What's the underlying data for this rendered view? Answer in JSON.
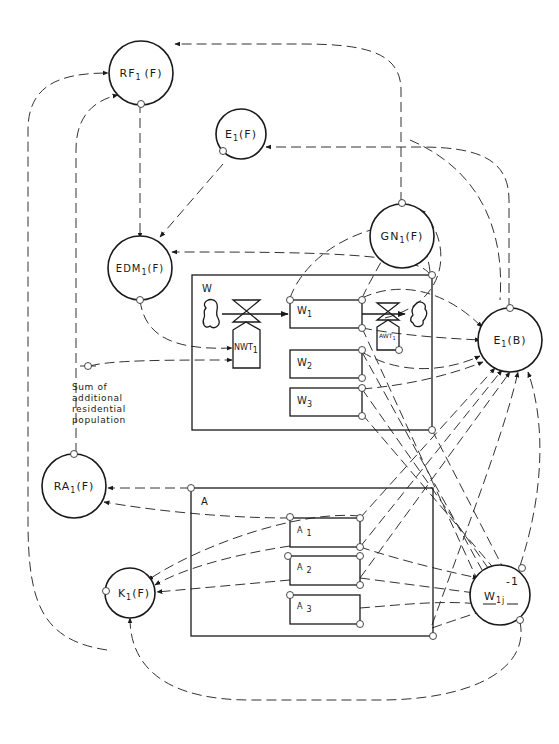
{
  "diagram": {
    "type": "system flow diagram",
    "nodes": {
      "rf1": {
        "main": "RF",
        "sub": "1",
        "suffix": "(F)"
      },
      "e1f": {
        "main": "E",
        "sub": "1",
        "suffix": "(F)"
      },
      "gn1": {
        "main": "GN",
        "sub": "1",
        "suffix": "(F)"
      },
      "edm1": {
        "main": "EDM",
        "sub": "1",
        "suffix": "(F)"
      },
      "e1b": {
        "main": "E",
        "sub": "1",
        "suffix": "(B)"
      },
      "ra1": {
        "main": "RA",
        "sub": "1",
        "suffix": "(F)"
      },
      "k1": {
        "main": "K",
        "sub": "1",
        "suffix": "(F)"
      },
      "w1j": {
        "main": "W",
        "sub": "1j",
        "sup": "-1"
      }
    },
    "groups": {
      "w": {
        "label": "W",
        "items": [
          {
            "main": "W",
            "sub": "1"
          },
          {
            "main": "W",
            "sub": "2"
          },
          {
            "main": "W",
            "sub": "3"
          }
        ]
      },
      "a": {
        "label": "A",
        "items": [
          {
            "main": "A",
            "sub": "1"
          },
          {
            "main": "A",
            "sub": "2"
          },
          {
            "main": "A",
            "sub": "3"
          }
        ]
      }
    },
    "valves": {
      "nwt": {
        "main": "NWT",
        "sub": "1"
      },
      "awt": {
        "main": "AWT",
        "sub": "1"
      }
    },
    "note": {
      "lines": [
        "Sum of",
        "additional",
        "residential",
        "population"
      ]
    }
  }
}
